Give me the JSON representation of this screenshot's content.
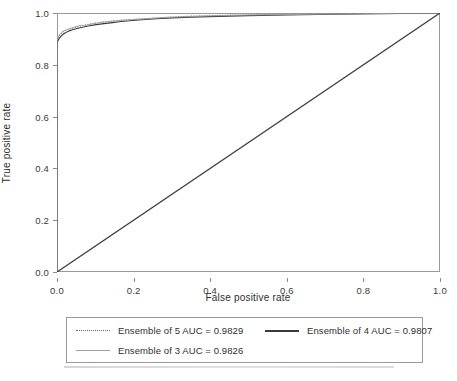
{
  "chart_data": {
    "type": "line",
    "title": "",
    "xlabel": "False positive rate",
    "ylabel": "True positive rate",
    "xlim": [
      0.0,
      1.0
    ],
    "ylim": [
      0.0,
      1.0
    ],
    "grid": false,
    "legend_position": "below-plot",
    "xticks": [
      "0.0",
      "0.2",
      "0.4",
      "0.6",
      "0.8",
      "1.0"
    ],
    "yticks": [
      "0.0",
      "0.2",
      "0.4",
      "0.6",
      "0.8",
      "1.0"
    ],
    "xtick_values": [
      0.0,
      0.2,
      0.4,
      0.6,
      0.8,
      1.0
    ],
    "ytick_values": [
      0.0,
      0.2,
      0.4,
      0.6,
      0.8,
      1.0
    ],
    "annotations": [
      "Diagonal chance reference line from (0,0) to (1,1)"
    ],
    "series": [
      {
        "name": "Ensemble of 5 AUC = 0.9829",
        "label": "Ensemble of 5 AUC = 0.9829",
        "model": "Ensemble of 5",
        "auc": 0.9829,
        "style": "dotted",
        "color": "#6f6f6f",
        "x": [
          0.0,
          0.0,
          0.004,
          0.008,
          0.012,
          0.018,
          0.024,
          0.03,
          0.038,
          0.046,
          0.055,
          0.062,
          0.07,
          0.08,
          0.09,
          0.1,
          0.112,
          0.124,
          0.138,
          0.15,
          0.165,
          0.18,
          0.196,
          0.212,
          0.23,
          0.25,
          0.272,
          0.295,
          0.32,
          0.35,
          0.4,
          0.46,
          0.52,
          0.6,
          0.7,
          0.8,
          0.9,
          1.0
        ],
        "y": [
          0.0,
          0.893,
          0.905,
          0.916,
          0.923,
          0.929,
          0.934,
          0.938,
          0.941,
          0.944,
          0.947,
          0.95,
          0.953,
          0.956,
          0.959,
          0.961,
          0.964,
          0.966,
          0.968,
          0.97,
          0.972,
          0.974,
          0.975,
          0.977,
          0.978,
          0.98,
          0.982,
          0.984,
          0.986,
          0.988,
          0.99,
          0.992,
          0.993,
          0.995,
          0.996,
          0.998,
          0.999,
          1.0
        ]
      },
      {
        "name": "Ensemble of 4 AUC = 0.9807",
        "label": "Ensemble of 4 AUC = 0.9807",
        "model": "Ensemble of 4",
        "auc": 0.9807,
        "style": "solid-dark",
        "color": "#3a3a3a",
        "x": [
          0.0,
          0.0,
          0.005,
          0.01,
          0.016,
          0.022,
          0.03,
          0.04,
          0.05,
          0.06,
          0.072,
          0.085,
          0.098,
          0.112,
          0.128,
          0.145,
          0.162,
          0.182,
          0.205,
          0.23,
          0.26,
          0.3,
          0.35,
          0.42,
          0.5,
          0.6,
          0.72,
          0.85,
          1.0
        ],
        "y": [
          0.0,
          0.886,
          0.9,
          0.91,
          0.918,
          0.924,
          0.93,
          0.935,
          0.939,
          0.943,
          0.947,
          0.951,
          0.954,
          0.957,
          0.96,
          0.963,
          0.966,
          0.969,
          0.972,
          0.975,
          0.978,
          0.981,
          0.984,
          0.987,
          0.99,
          0.992,
          0.995,
          0.997,
          1.0
        ]
      },
      {
        "name": "Ensemble of 3 AUC = 0.9826",
        "label": "Ensemble of 3 AUC = 0.9826",
        "model": "Ensemble of 3",
        "auc": 0.9826,
        "style": "solid-light",
        "color": "#9f9f9f",
        "x": [
          0.0,
          0.0,
          0.003,
          0.007,
          0.012,
          0.018,
          0.026,
          0.034,
          0.042,
          0.05,
          0.058,
          0.064,
          0.07,
          0.078,
          0.088,
          0.1,
          0.115,
          0.13,
          0.146,
          0.163,
          0.182,
          0.202,
          0.225,
          0.252,
          0.285,
          0.325,
          0.38,
          0.45,
          0.54,
          0.65,
          0.78,
          0.9,
          1.0
        ],
        "y": [
          0.0,
          0.895,
          0.908,
          0.918,
          0.925,
          0.931,
          0.936,
          0.94,
          0.944,
          0.948,
          0.951,
          0.953,
          0.95,
          0.953,
          0.957,
          0.96,
          0.963,
          0.966,
          0.968,
          0.971,
          0.973,
          0.975,
          0.977,
          0.98,
          0.983,
          0.985,
          0.988,
          0.991,
          0.993,
          0.995,
          0.997,
          0.999,
          1.0
        ]
      },
      {
        "name": "Chance reference",
        "label": "",
        "model": "chance",
        "auc": 0.5,
        "style": "solid-dark",
        "color": "#3f3f3f",
        "x": [
          0.0,
          1.0
        ],
        "y": [
          0.0,
          1.0
        ]
      }
    ]
  },
  "axes": {
    "x": {
      "label": "False positive rate",
      "ticks": [
        "0.0",
        "0.2",
        "0.4",
        "0.6",
        "0.8",
        "1.0"
      ]
    },
    "y": {
      "label": "True positive rate",
      "ticks": [
        "0.0",
        "0.2",
        "0.4",
        "0.6",
        "0.8",
        "1.0"
      ]
    }
  },
  "legend": {
    "entries": [
      {
        "label": "Ensemble of 5 AUC = 0.9829",
        "style": "dotted",
        "color": "#6f6f6f"
      },
      {
        "label": "Ensemble of 4 AUC = 0.9807",
        "style": "solid-dark",
        "color": "#3a3a3a"
      },
      {
        "label": "Ensemble of 3 AUC = 0.9826",
        "style": "solid-light",
        "color": "#9f9f9f"
      }
    ]
  },
  "colors": {
    "background": "#ffffff",
    "frame": "#9a9a9a",
    "text": "#2f2f2f",
    "diagonal": "#3f3f3f"
  }
}
